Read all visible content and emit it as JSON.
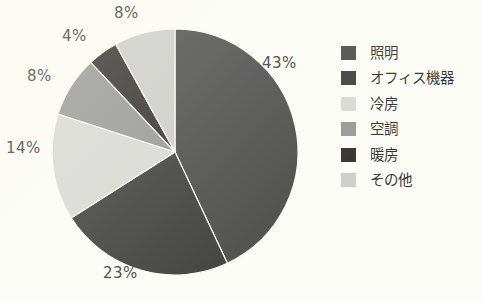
{
  "background_color": "#fdfdf8",
  "chart_data": {
    "type": "pie",
    "title": "",
    "subtitle": "",
    "xlabel": "",
    "ylabel": "",
    "grid": false,
    "legend_position": "right",
    "unit": "%",
    "center": {
      "x": 175,
      "y": 152
    },
    "radius": 123,
    "start_angle_deg": 0,
    "direction": "clockwise",
    "categories": [
      "照明",
      "オフィス機器",
      "冷房",
      "空調",
      "暖房",
      "その他"
    ],
    "values": [
      43,
      23,
      14,
      8,
      4,
      8
    ],
    "labels": [
      "43%",
      "23%",
      "14%",
      "8%",
      "4%",
      "8%"
    ],
    "colors": [
      "#3b3b3b",
      "#2b2b2b",
      "#d5d5d2",
      "#8e8e8e",
      "#201c1c",
      "#c9c9c6"
    ],
    "slices": [
      {
        "name": "照明",
        "value": 43,
        "label": "43%",
        "color": "#3b3b3b"
      },
      {
        "name": "オフィス機器",
        "value": 23,
        "label": "23%",
        "color": "#2b2b2b"
      },
      {
        "name": "冷房",
        "value": 14,
        "label": "14%",
        "color": "#d5d5d2"
      },
      {
        "name": "空調",
        "value": 8,
        "label": "8%",
        "color": "#8e8e8e"
      },
      {
        "name": "暖房",
        "value": 4,
        "label": "4%",
        "color": "#201c1c"
      },
      {
        "name": "その他",
        "value": 8,
        "label": "8%",
        "color": "#c9c9c6"
      }
    ]
  },
  "pie": {
    "label_43": "43%",
    "label_23": "23%",
    "label_14": "14%",
    "label_8_left": "8%",
    "label_4": "4%",
    "label_8_top": "8%"
  },
  "legend": {
    "items": [
      {
        "label": "照明",
        "color": "#3b3b3b",
        "icon": "legend-swatch-icon"
      },
      {
        "label": "オフィス機器",
        "color": "#2b2b2b",
        "icon": "legend-swatch-icon"
      },
      {
        "label": "冷房",
        "color": "#d5d5d2",
        "icon": "legend-swatch-icon"
      },
      {
        "label": "空調",
        "color": "#8e8e8e",
        "icon": "legend-swatch-icon"
      },
      {
        "label": "暖房",
        "color": "#201c1c",
        "icon": "legend-swatch-icon"
      },
      {
        "label": "その他",
        "color": "#c9c9c6",
        "icon": "legend-swatch-icon"
      }
    ]
  }
}
